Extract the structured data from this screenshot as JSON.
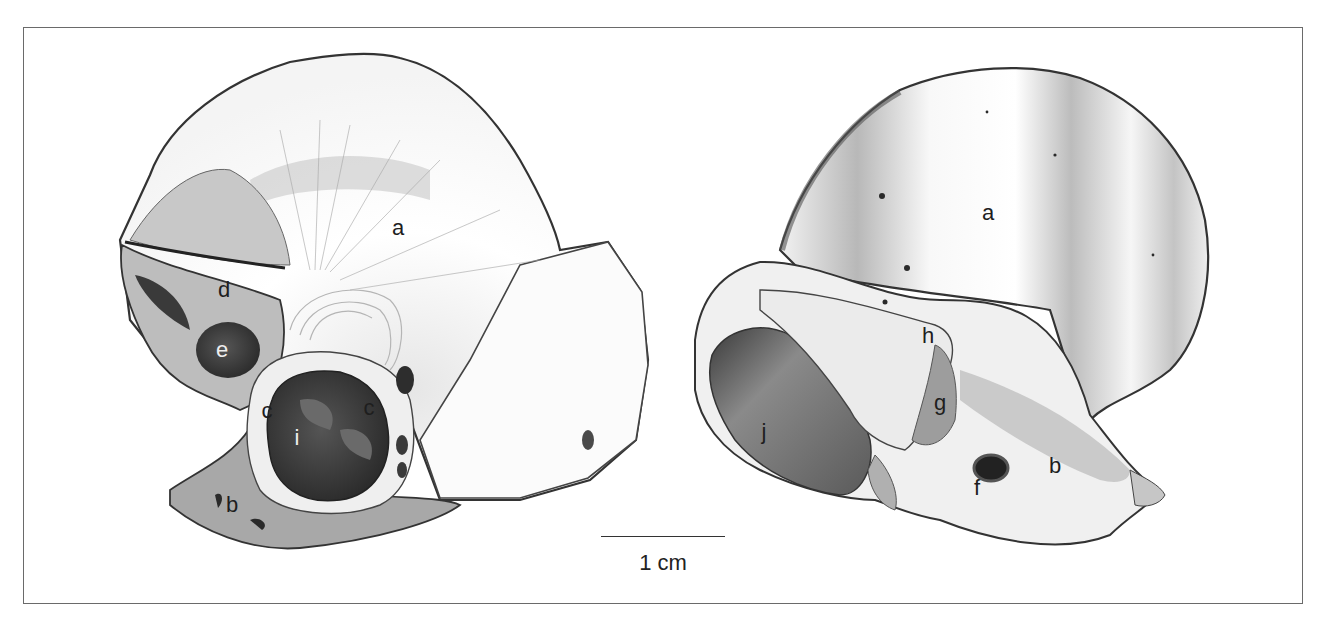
{
  "figure": {
    "type": "anatomical-illustration",
    "views": [
      {
        "id": "left-view",
        "labels": [
          {
            "text": "a",
            "x": 398,
            "y": 228
          },
          {
            "text": "d",
            "x": 224,
            "y": 290
          },
          {
            "text": "e",
            "x": 222,
            "y": 350
          },
          {
            "text": "c",
            "x": 267,
            "y": 411
          },
          {
            "text": "c",
            "x": 369,
            "y": 408
          },
          {
            "text": "i",
            "x": 297,
            "y": 438
          },
          {
            "text": "b",
            "x": 232,
            "y": 505
          }
        ]
      },
      {
        "id": "right-view",
        "labels": [
          {
            "text": "a",
            "x": 988,
            "y": 213
          },
          {
            "text": "h",
            "x": 928,
            "y": 336
          },
          {
            "text": "g",
            "x": 940,
            "y": 403
          },
          {
            "text": "j",
            "x": 764,
            "y": 432
          },
          {
            "text": "f",
            "x": 977,
            "y": 488
          },
          {
            "text": "b",
            "x": 1055,
            "y": 466
          }
        ]
      }
    ],
    "scale_bar": {
      "label": "1 cm"
    },
    "colors": {
      "ink": "#1e1e1e",
      "frame": "#6a6a6a",
      "shade_dark": "#3a3a3a",
      "shade_mid": "#9a9a9a",
      "shade_light": "#d8d8d8"
    }
  }
}
